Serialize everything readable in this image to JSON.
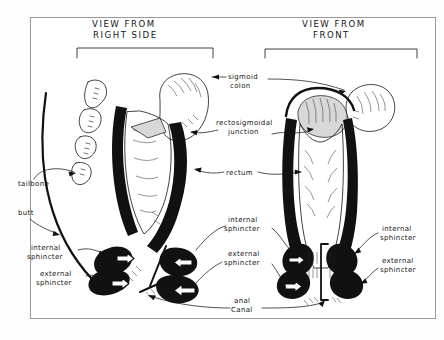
{
  "document": {
    "kind": "hand-drawn anatomical illustration",
    "subject": "Rectum and anal canal anatomy",
    "background_color": "#ffffff",
    "ink_color": "#111111",
    "frame_color": "#9a9a9a"
  },
  "panels": [
    {
      "id": "left",
      "title_line1": "VIEW FROM",
      "title_line2": "RIGHT SIDE",
      "bracket": true
    },
    {
      "id": "right",
      "title_line1": "VIEW FROM",
      "title_line2": "FRONT",
      "bracket": true
    }
  ],
  "labels": {
    "sigmoid_colon_line1": "sigmoid",
    "sigmoid_colon_line2": "colon",
    "rectosigmoidal_line1": "rectosigmoidal",
    "rectosigmoidal_line2": "junction",
    "rectum": "rectum",
    "tailbone": "tailbone",
    "butt": "butt",
    "internal_sphincter_line1": "internal",
    "internal_sphincter_line2": "sphincter",
    "external_sphincter_line1": "external",
    "external_sphincter_line2": "sphincter",
    "anal_canal_line1": "anal",
    "anal_canal_line2": "Canal",
    "center_internal_line1": "internal",
    "center_internal_line2": "sphincter",
    "center_external_line1": "external",
    "center_external_line2": "sphincter",
    "right_internal_line1": "internal",
    "right_internal_line2": "sphincter",
    "right_external_line1": "external",
    "right_external_line2": "sphincter"
  }
}
